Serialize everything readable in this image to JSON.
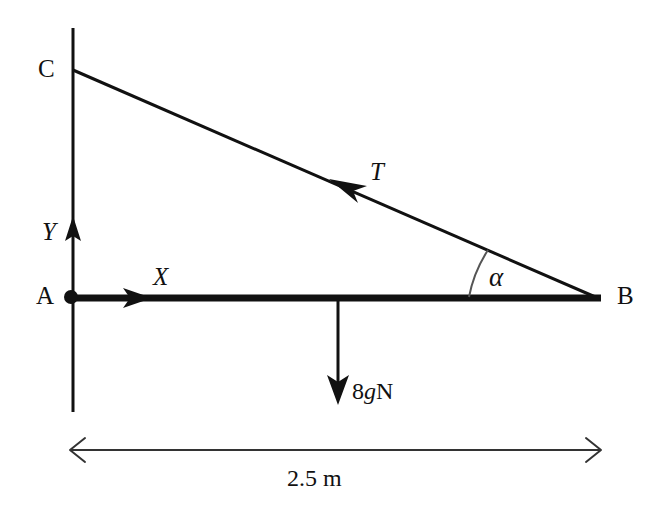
{
  "figure": {
    "type": "free-body-diagram",
    "background_color": "#ffffff",
    "stroke_color": "#111111"
  },
  "points": {
    "a": {
      "label": "A",
      "x": 71,
      "y": 297
    },
    "b": {
      "label": "B",
      "x": 600,
      "y": 299
    },
    "c": {
      "label": "C",
      "x": 73,
      "y": 70
    }
  },
  "axes": {
    "x_label": "X",
    "y_label": "Y"
  },
  "forces": {
    "tension": {
      "label": "T",
      "direction": "from B toward C along the string"
    },
    "weight": {
      "label_number": "8",
      "label_symbol": "g",
      "label_unit": "N",
      "label_full": "8gN",
      "direction": "vertically downward at rod midpoint"
    }
  },
  "angle": {
    "label": "α",
    "at_point": "B",
    "between": "rod AB and string BC"
  },
  "dimension": {
    "label": "2.5 m",
    "value": "2.5",
    "unit": "m",
    "measures": "length of rod AB"
  }
}
